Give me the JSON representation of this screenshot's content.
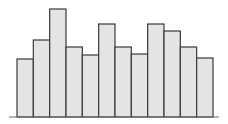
{
  "chart_data": {
    "type": "bar",
    "title": "",
    "xlabel": "",
    "ylabel": "",
    "categories": [
      "1",
      "2",
      "3",
      "4",
      "5",
      "6",
      "7",
      "8",
      "9",
      "10",
      "11",
      "12"
    ],
    "values": [
      58,
      77,
      108,
      70,
      62,
      93,
      70,
      63,
      93,
      86,
      70,
      59
    ],
    "ylim": [
      0,
      112
    ],
    "grid": false,
    "legend": "none",
    "show_tick_labels": false,
    "colors": {
      "bar_fill": "#e4e4e4",
      "bar_edge": "#3a3a3a",
      "axis": "#6a6a6a"
    }
  }
}
